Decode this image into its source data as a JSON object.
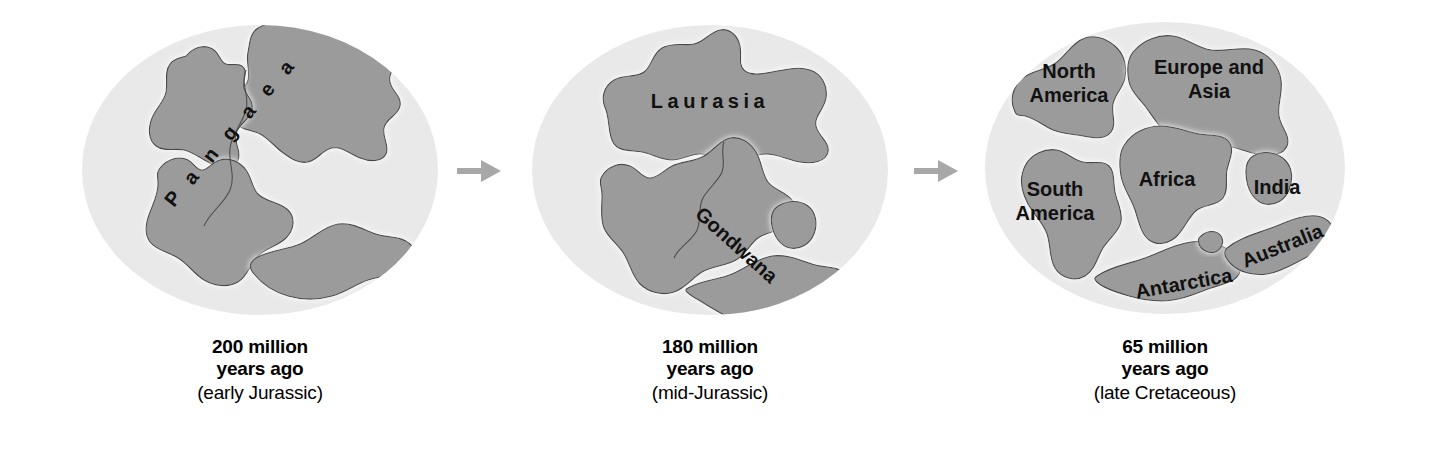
{
  "figure": {
    "background_color": "#ffffff",
    "ocean_color": "#e9e9e9",
    "land_color": "#9b9b9b",
    "land_outline_color": "#4a4a4a",
    "land_halo_color": "#fbfbfb",
    "arrow_color": "#a8a8a8",
    "label_color": "#111111"
  },
  "panels": [
    {
      "id": "panel-pangaea",
      "caption": {
        "line1": "200 million",
        "line2": "years ago",
        "line3": "(early Jurassic)"
      },
      "labels": [
        {
          "text": "Pangaea",
          "style": "arc-letters"
        }
      ],
      "landmass_names": [
        "Pangaea supercontinent"
      ]
    },
    {
      "id": "panel-laurasia-gondwana",
      "caption": {
        "line1": "180 million",
        "line2": "years ago",
        "line3": "(mid-Jurassic)"
      },
      "labels": [
        {
          "text": "Laurasia",
          "style": "spaced-horizontal"
        },
        {
          "text": "Gondwana",
          "style": "rotated-diagonal"
        }
      ],
      "landmass_names": [
        "Laurasia",
        "Gondwana"
      ]
    },
    {
      "id": "panel-modern-continents",
      "caption": {
        "line1": "65 million",
        "line2": "years ago",
        "line3": "(late Cretaceous)"
      },
      "labels": [
        {
          "text": "North",
          "style": "horizontal"
        },
        {
          "text": "America",
          "style": "horizontal"
        },
        {
          "text": "Europe and",
          "style": "horizontal"
        },
        {
          "text": "Asia",
          "style": "horizontal"
        },
        {
          "text": "South",
          "style": "horizontal"
        },
        {
          "text": "America",
          "style": "horizontal"
        },
        {
          "text": "Africa",
          "style": "horizontal"
        },
        {
          "text": "India",
          "style": "horizontal"
        },
        {
          "text": "Antarctica",
          "style": "rotated-diagonal"
        },
        {
          "text": "Australia",
          "style": "rotated-diagonal"
        }
      ],
      "landmass_names": [
        "North America",
        "Europe and Asia",
        "South America",
        "Africa",
        "India",
        "Antarctica",
        "Australia"
      ]
    }
  ],
  "arrows": [
    {
      "id": "arrow-1",
      "direction": "right"
    },
    {
      "id": "arrow-2",
      "direction": "right"
    }
  ]
}
